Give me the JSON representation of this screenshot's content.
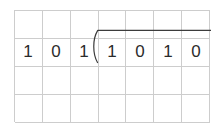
{
  "worksheet": {
    "title": "Binary long division worksheet",
    "background_color": "#ffffff",
    "grid": {
      "columns": 7,
      "rows": 4,
      "line_color": "#cdcdcd",
      "cell_width": 28,
      "cell_height": 28
    },
    "division": {
      "notation": "long-division",
      "divisor_label": "divisor",
      "dividend_label": "dividend",
      "divisor_digits": [
        "1",
        "0",
        "1"
      ],
      "dividend_digits": [
        "1",
        "0",
        "1",
        "0"
      ],
      "bracket_icon": "division-bracket-icon",
      "bracket_color": "#3c3c3c",
      "digit_color": "#2b2b2b"
    },
    "cells": [
      {
        "row": 1,
        "col": 1,
        "text": ""
      },
      {
        "row": 1,
        "col": 2,
        "text": ""
      },
      {
        "row": 1,
        "col": 3,
        "text": ""
      },
      {
        "row": 1,
        "col": 4,
        "text": ""
      },
      {
        "row": 1,
        "col": 5,
        "text": ""
      },
      {
        "row": 1,
        "col": 6,
        "text": ""
      },
      {
        "row": 1,
        "col": 7,
        "text": ""
      },
      {
        "row": 2,
        "col": 1,
        "text": "1"
      },
      {
        "row": 2,
        "col": 2,
        "text": "0"
      },
      {
        "row": 2,
        "col": 3,
        "text": "1"
      },
      {
        "row": 2,
        "col": 4,
        "text": "1"
      },
      {
        "row": 2,
        "col": 5,
        "text": "0"
      },
      {
        "row": 2,
        "col": 6,
        "text": "1"
      },
      {
        "row": 2,
        "col": 7,
        "text": "0"
      },
      {
        "row": 3,
        "col": 1,
        "text": ""
      },
      {
        "row": 3,
        "col": 2,
        "text": ""
      },
      {
        "row": 3,
        "col": 3,
        "text": ""
      },
      {
        "row": 3,
        "col": 4,
        "text": ""
      },
      {
        "row": 3,
        "col": 5,
        "text": ""
      },
      {
        "row": 3,
        "col": 6,
        "text": ""
      },
      {
        "row": 3,
        "col": 7,
        "text": ""
      },
      {
        "row": 4,
        "col": 1,
        "text": ""
      },
      {
        "row": 4,
        "col": 2,
        "text": ""
      },
      {
        "row": 4,
        "col": 3,
        "text": ""
      },
      {
        "row": 4,
        "col": 4,
        "text": ""
      },
      {
        "row": 4,
        "col": 5,
        "text": ""
      },
      {
        "row": 4,
        "col": 6,
        "text": ""
      },
      {
        "row": 4,
        "col": 7,
        "text": ""
      }
    ],
    "digit_row_index": 2,
    "digits": [
      {
        "value": "1",
        "col": 1
      },
      {
        "value": "0",
        "col": 2
      },
      {
        "value": "1",
        "col": 3
      },
      {
        "value": "1",
        "col": 4
      },
      {
        "value": "0",
        "col": 5
      },
      {
        "value": "1",
        "col": 6
      },
      {
        "value": "0",
        "col": 7
      }
    ]
  }
}
